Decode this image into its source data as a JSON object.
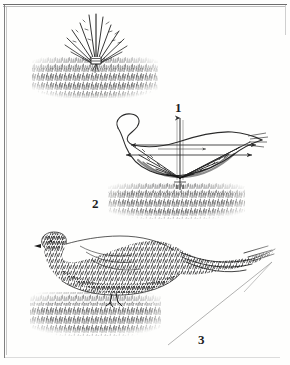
{
  "plate": {
    "title": "Bird construction sequence",
    "background_color": "#fefefd",
    "frame_color": "#6d6d6d",
    "ink_color": "#1d1d1d"
  },
  "labels": [
    {
      "name": "step-1",
      "text": "1",
      "x": 175,
      "y": 101
    },
    {
      "name": "step-2",
      "text": "2",
      "x": 92,
      "y": 197
    },
    {
      "name": "step-3",
      "text": "3",
      "x": 198,
      "y": 333
    }
  ],
  "figures": [
    {
      "id": "figure-1",
      "label": "1",
      "description": "Radiating feather-stub sprout rising from a stippled ground band",
      "ground_band": {
        "x": 32,
        "y": 57,
        "width": 126,
        "height": 41
      },
      "subject": {
        "type": "sprout",
        "cx": 96,
        "base_y": 60,
        "top_y": 15,
        "ray_count": 13
      }
    },
    {
      "id": "figure-2",
      "label": "2",
      "description": "Bird outline with vertical axis, horizontal construction lines, arrowheads and radiating guide rays",
      "ground_band": {
        "x": 108,
        "y": 183,
        "width": 137,
        "height": 36
      },
      "subject": {
        "type": "outline-with-guides",
        "axis_x": 180,
        "axis_top_y": 118,
        "axis_bottom_y": 180,
        "guide_rays": 11,
        "arrow_lines": 2,
        "head_cx": 128,
        "head_cy": 126,
        "tail_tip_x": 262,
        "tail_tip_y": 140
      }
    },
    {
      "id": "figure-3",
      "label": "3",
      "description": "Finished stippled bird with long tail standing on a stippled ground band, with a faint diagonal guide line to the tail tip",
      "ground_band": {
        "x": 30,
        "y": 292,
        "width": 131,
        "height": 44
      },
      "subject": {
        "type": "rendered-bird",
        "head_cx": 48,
        "head_cy": 245,
        "body_cx": 105,
        "body_cy": 268,
        "tail_tip_x": 272,
        "tail_tip_y": 262,
        "guide_line": {
          "x1": 168,
          "y1": 345,
          "x2": 272,
          "y2": 262
        }
      }
    }
  ]
}
